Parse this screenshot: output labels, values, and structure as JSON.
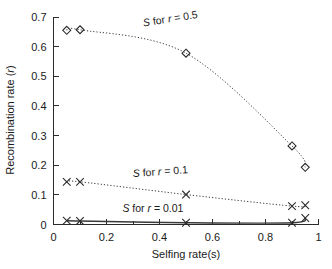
{
  "chart_data": {
    "type": "line",
    "title": "",
    "xlabel": "Selfing rate(s)",
    "ylabel": "Recombination rate (r)",
    "xlim": [
      0,
      1
    ],
    "ylim": [
      0,
      0.7
    ],
    "xticks": [
      "0",
      "0.2",
      "0.4",
      "0.6",
      "0.8",
      "1"
    ],
    "xtick_values": [
      0,
      0.2,
      0.4,
      0.6,
      0.8,
      1
    ],
    "xminor_values": [
      0.1,
      0.3,
      0.5,
      0.7,
      0.9
    ],
    "yticks": [
      "0",
      "0.1",
      "0.2",
      "0.3",
      "0.4",
      "0.5",
      "0.6",
      "0.7"
    ],
    "ytick_values": [
      0,
      0.1,
      0.2,
      0.3,
      0.4,
      0.5,
      0.6,
      0.7
    ],
    "grid": false,
    "legend_position": "inline-annotations",
    "series": [
      {
        "name": "S for r = 0.5",
        "label_html": "<tspan class=\"ital\">S</tspan> for <tspan class=\"ital\">r</tspan> = 0.5",
        "marker": "diamond",
        "linestyle": "dotted",
        "x": [
          0.05,
          0.1,
          0.5,
          0.9,
          0.95
        ],
        "y": [
          0.655,
          0.657,
          0.578,
          0.265,
          0.193
        ],
        "label_x": 0.34,
        "label_y": 0.668,
        "label_rotation": -9
      },
      {
        "name": "S for r = 0.1",
        "label_html": "<tspan class=\"ital\">S</tspan> for <tspan class=\"ital\">r</tspan> = 0.1",
        "marker": "x",
        "linestyle": "dotted",
        "x": [
          0.05,
          0.1,
          0.5,
          0.9,
          0.95
        ],
        "y": [
          0.144,
          0.144,
          0.101,
          0.062,
          0.065
        ],
        "label_x": 0.3,
        "label_y": 0.16,
        "label_rotation": -4
      },
      {
        "name": "S for r = 0.01",
        "label_html": "<tspan class=\"ital\">S</tspan> for <tspan class=\"ital\">r</tspan> = 0.01",
        "marker": "x",
        "linestyle": "solid",
        "x": [
          0.05,
          0.1,
          0.5,
          0.9,
          0.95
        ],
        "y": [
          0.013,
          0.012,
          0.006,
          0.006,
          0.022
        ],
        "label_x": 0.26,
        "label_y": 0.042,
        "label_rotation": 0
      }
    ]
  },
  "axes": {
    "x_title": "Selfing rate(s)",
    "y_title_prefix": "Recombination rate (",
    "y_title_var": "r",
    "y_title_suffix": ")"
  }
}
